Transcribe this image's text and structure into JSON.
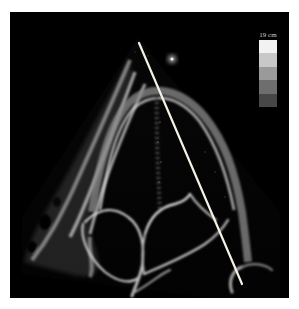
{
  "image": {
    "description": "Echocardiogram apical four-chamber view with M-mode cursor line",
    "depth_label": "19 cm",
    "grayscale_bar": {
      "bands": [
        "#f2f2f2",
        "#c8c8c8",
        "#9a9a9a",
        "#6e6e6e",
        "#474747"
      ]
    },
    "cursor_line": {
      "color": "#f4f0e4",
      "start": [
        129,
        31
      ],
      "end": [
        232,
        272
      ]
    },
    "marker_dot": {
      "center": [
        162,
        47
      ],
      "color": "#d8d8d8"
    }
  }
}
